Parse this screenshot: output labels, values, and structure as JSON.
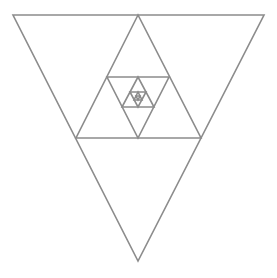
{
  "diagram": {
    "title": "",
    "stroke_color": "#8c8c8c",
    "stroke_width": 1.6,
    "background": "#ffffff",
    "triangles": [
      {
        "id": "t1",
        "orientation": "down",
        "points": [
          [
            13,
            15
          ],
          [
            264,
            15
          ],
          [
            138,
            261
          ]
        ]
      },
      {
        "id": "t2",
        "orientation": "up",
        "points": [
          [
            138,
            15
          ],
          [
            76,
            138
          ],
          [
            201,
            138
          ]
        ]
      },
      {
        "id": "t3",
        "orientation": "down",
        "points": [
          [
            107,
            77
          ],
          [
            169,
            77
          ],
          [
            138,
            138
          ]
        ]
      },
      {
        "id": "t4",
        "orientation": "up",
        "points": [
          [
            138,
            77
          ],
          [
            122,
            107
          ],
          [
            154,
            107
          ]
        ]
      },
      {
        "id": "t5",
        "orientation": "down",
        "points": [
          [
            130,
            92
          ],
          [
            146,
            92
          ],
          [
            138,
            107
          ]
        ]
      },
      {
        "id": "t6",
        "orientation": "up",
        "points": [
          [
            138,
            92
          ],
          [
            134,
            100
          ],
          [
            142,
            100
          ]
        ]
      },
      {
        "id": "t7",
        "orientation": "down",
        "points": [
          [
            136,
            96
          ],
          [
            140,
            96
          ],
          [
            138,
            100
          ]
        ]
      }
    ]
  }
}
